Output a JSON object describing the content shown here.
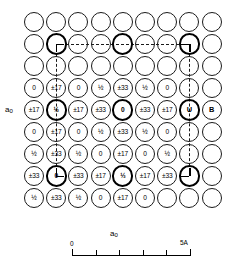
{
  "figure": {
    "type": "crystal-structure-projection"
  },
  "axes": {
    "y_label": "a",
    "y_subscript": "0",
    "x_label": "a",
    "x_subscript": "0"
  },
  "scale": {
    "start_label": "0",
    "end_label": "5A",
    "tick_count": 6,
    "major_ticks": [
      0,
      1,
      2,
      3,
      4,
      5
    ]
  },
  "lattice": {
    "columns": 9,
    "rows": 9,
    "origin_x": 34,
    "origin_y": 22,
    "spacing_x": 22.2,
    "spacing_y": 22.0,
    "radius_thin": 10.0,
    "radius_bold": 10.6,
    "colors": {
      "outline": "#1a1a1a",
      "outline_bold": "#000000",
      "background": "#ffffff",
      "text": "#000000"
    },
    "rows_data": [
      {
        "index": 0,
        "cells": [
          {
            "label": "",
            "bold": false
          },
          {
            "label": "",
            "bold": false
          },
          {
            "label": "",
            "bold": false
          },
          {
            "label": "",
            "bold": false
          },
          {
            "label": "",
            "bold": false
          },
          {
            "label": "",
            "bold": false
          },
          {
            "label": "",
            "bold": false
          },
          {
            "label": "",
            "bold": false
          },
          {
            "label": "",
            "bold": false
          }
        ]
      },
      {
        "index": 1,
        "cells": [
          {
            "label": "",
            "bold": false
          },
          {
            "label": "",
            "bold": true,
            "corner": "tl"
          },
          {
            "label": "",
            "bold": false
          },
          {
            "label": "",
            "bold": false
          },
          {
            "label": "",
            "bold": true
          },
          {
            "label": "",
            "bold": false
          },
          {
            "label": "",
            "bold": false
          },
          {
            "label": "",
            "bold": true,
            "corner": "tr"
          },
          {
            "label": "",
            "bold": false
          }
        ]
      },
      {
        "index": 2,
        "cells": [
          {
            "label": "",
            "bold": false
          },
          {
            "label": "",
            "bold": false
          },
          {
            "label": "",
            "bold": false
          },
          {
            "label": "",
            "bold": false
          },
          {
            "label": "",
            "bold": false
          },
          {
            "label": "",
            "bold": false
          },
          {
            "label": "",
            "bold": false
          },
          {
            "label": "",
            "bold": false
          },
          {
            "label": "",
            "bold": false
          }
        ]
      },
      {
        "index": 3,
        "cells": [
          {
            "label": "0",
            "bold": false
          },
          {
            "label": "±17",
            "bold": false
          },
          {
            "label": "0",
            "bold": false
          },
          {
            "label": "½",
            "bold": false,
            "frac": true
          },
          {
            "label": "±33",
            "bold": false
          },
          {
            "label": "½",
            "bold": false,
            "frac": true
          },
          {
            "label": "0",
            "bold": false
          },
          {
            "label": "",
            "bold": false
          },
          {
            "label": "",
            "bold": false
          }
        ]
      },
      {
        "index": 4,
        "cells": [
          {
            "label": "±17",
            "bold": false
          },
          {
            "label": "½",
            "bold": true,
            "frac": true
          },
          {
            "label": "±17",
            "bold": false
          },
          {
            "label": "±33",
            "bold": false
          },
          {
            "label": "0",
            "bold": true
          },
          {
            "label": "±33",
            "bold": false
          },
          {
            "label": "±17",
            "bold": false
          },
          {
            "label": "U",
            "bold": true,
            "big": true
          },
          {
            "label": "B",
            "bold": false,
            "big": true
          }
        ]
      },
      {
        "index": 5,
        "cells": [
          {
            "label": "0",
            "bold": false
          },
          {
            "label": "±17",
            "bold": false
          },
          {
            "label": "0",
            "bold": false
          },
          {
            "label": "½",
            "bold": false,
            "frac": true
          },
          {
            "label": "±33",
            "bold": false
          },
          {
            "label": "½",
            "bold": false,
            "frac": true
          },
          {
            "label": "0",
            "bold": false
          },
          {
            "label": "",
            "bold": false
          },
          {
            "label": "",
            "bold": false
          }
        ]
      },
      {
        "index": 6,
        "cells": [
          {
            "label": "½",
            "bold": false,
            "frac": true
          },
          {
            "label": "±33",
            "bold": false
          },
          {
            "label": "½",
            "bold": false,
            "frac": true
          },
          {
            "label": "0",
            "bold": false
          },
          {
            "label": "±17",
            "bold": false
          },
          {
            "label": "0",
            "bold": false
          },
          {
            "label": "½",
            "bold": false,
            "frac": true
          },
          {
            "label": "",
            "bold": false
          },
          {
            "label": "",
            "bold": false
          }
        ]
      },
      {
        "index": 7,
        "cells": [
          {
            "label": "±33",
            "bold": false
          },
          {
            "label": "0",
            "bold": true,
            "corner": "bl"
          },
          {
            "label": "±33",
            "bold": false
          },
          {
            "label": "±17",
            "bold": false
          },
          {
            "label": "½",
            "bold": true,
            "frac": true
          },
          {
            "label": "±17",
            "bold": false
          },
          {
            "label": "±33",
            "bold": false
          },
          {
            "label": "",
            "bold": true,
            "corner": "br"
          },
          {
            "label": "",
            "bold": false
          }
        ]
      },
      {
        "index": 8,
        "cells": [
          {
            "label": "½",
            "bold": false,
            "frac": true
          },
          {
            "label": "±33",
            "bold": false
          },
          {
            "label": "½",
            "bold": false,
            "frac": true
          },
          {
            "label": "0",
            "bold": false
          },
          {
            "label": "±17",
            "bold": false
          },
          {
            "label": "0",
            "bold": false
          },
          {
            "label": "",
            "bold": false
          },
          {
            "label": "",
            "bold": false
          },
          {
            "label": "",
            "bold": false
          }
        ]
      }
    ],
    "legend_atoms": [
      {
        "symbol": "U",
        "meaning": "uranium-site"
      },
      {
        "symbol": "B",
        "meaning": "boron-site"
      }
    ],
    "height_values": [
      "0",
      "±17",
      "±33",
      "½"
    ]
  }
}
